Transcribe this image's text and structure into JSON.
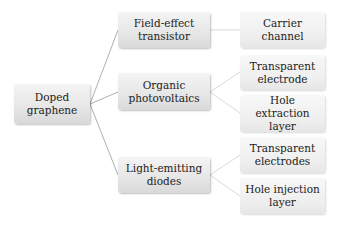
{
  "diagram": {
    "root": {
      "label": "Doped\ngraphene"
    },
    "branches": [
      {
        "label": "Field-effect\ntransistor",
        "children": [
          {
            "label": "Carrier\nchannel"
          }
        ]
      },
      {
        "label": "Organic\nphotovoltaics",
        "children": [
          {
            "label": "Transparent\nelectrode"
          },
          {
            "label": "Hole\nextraction\nlayer"
          }
        ]
      },
      {
        "label": "Light-emitting\ndiodes",
        "children": [
          {
            "label": "Transparent\nelectrodes"
          },
          {
            "label": "Hole injection\nlayer"
          }
        ]
      }
    ],
    "colors": {
      "node_fill_top": "#f4f4f4",
      "node_fill_bottom": "#d9d9d9",
      "connector": "#9a9a9a",
      "leaf_connector": "#cfcfcf",
      "text": "#222222"
    }
  }
}
